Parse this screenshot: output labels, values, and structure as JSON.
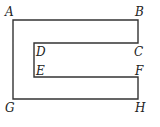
{
  "diagram": {
    "type": "polygon-figure",
    "shape": "C-shaped outline",
    "stroke_color": "#333333",
    "background": "#ffffff",
    "vertices": [
      {
        "label": "A",
        "x": 13,
        "y": 20
      },
      {
        "label": "B",
        "x": 138,
        "y": 20
      },
      {
        "label": "C",
        "x": 138,
        "y": 43
      },
      {
        "label": "D",
        "x": 34,
        "y": 43
      },
      {
        "label": "E",
        "x": 34,
        "y": 77
      },
      {
        "label": "F",
        "x": 138,
        "y": 77
      },
      {
        "label": "H",
        "x": 138,
        "y": 99
      },
      {
        "label": "G",
        "x": 13,
        "y": 99
      }
    ],
    "labels": {
      "A": "A",
      "B": "B",
      "C": "C",
      "D": "D",
      "E": "E",
      "F": "F",
      "G": "G",
      "H": "H"
    }
  }
}
